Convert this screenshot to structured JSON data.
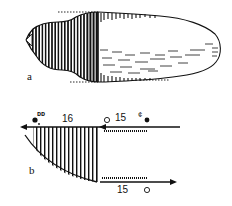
{
  "figure": {
    "panel_a": {
      "label": "a",
      "description": "Elongated specimen with vertically striated (hatched) anterior region and lightly dashed posterior body, bounded by dashed guide lines"
    },
    "panel_b": {
      "label": "b",
      "top_left_value": "16",
      "top_right_value": "15",
      "bottom_value": "15",
      "top_left_symbol": "• ᴅᴅ",
      "top_right_symbol": "¢ •",
      "open_circle_top": "○",
      "open_circle_bottom": "○"
    }
  },
  "colors": {
    "ink": "#111111",
    "background": "#ffffff"
  }
}
